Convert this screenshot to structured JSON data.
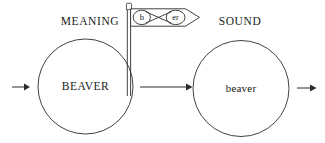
{
  "canvas": {
    "width": 325,
    "height": 143,
    "background_color": "#ffffff",
    "stroke_color": "#2b2b2b",
    "text_color": "#1a1a1a"
  },
  "headings": {
    "left": "MEANING",
    "right": "SOUND"
  },
  "nodes": {
    "meaning_circle": {
      "label": "BEAVER",
      "cx": 85.5,
      "cy": 86.5,
      "r": 47.5
    },
    "sound_circle": {
      "label": "beaver",
      "cx": 241,
      "cy": 88.5,
      "r": 48
    }
  },
  "flag": {
    "left_oval_text": "b",
    "right_oval_text": "er",
    "pole_x": 129,
    "pole_top_y": 8,
    "pole_bottom_y": 96,
    "banner_top_y": 8.5,
    "banner_bottom_y": 26
  },
  "arrows": [
    {
      "name": "input-arrow",
      "x1": 12,
      "x2": 29,
      "y": 87
    },
    {
      "name": "transfer-arrow",
      "x1": 140,
      "x2": 192,
      "y": 87
    },
    {
      "name": "output-arrow",
      "x1": 297,
      "x2": 317,
      "y": 88
    }
  ]
}
